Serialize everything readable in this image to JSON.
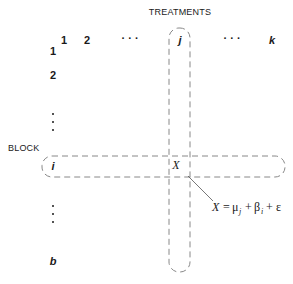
{
  "diagram": {
    "title": "TREATMENTS",
    "row_axis_label": "BLOCK",
    "columns": [
      {
        "label": "1",
        "x": 64
      },
      {
        "label": "2",
        "x": 87
      },
      {
        "label": "· · ·",
        "x": 130
      },
      {
        "label": "j",
        "x": 180
      },
      {
        "label": "· · ·",
        "x": 232
      },
      {
        "label": "k",
        "x": 272
      }
    ],
    "rows": [
      {
        "label": "1",
        "y": 54
      },
      {
        "label": "2",
        "y": 78
      },
      {
        "label": "i",
        "y": 170
      },
      {
        "label": "b",
        "y": 265
      }
    ],
    "row_ellipsis_upper": ".",
    "row_ellipsis_lower": ".",
    "cell_label": "X",
    "equation": {
      "lhs": "X",
      "equals": "=",
      "mu": "μ",
      "mu_sub": "j",
      "plus1": "+",
      "beta": "β",
      "beta_sub": "i",
      "plus2": "+",
      "epsilon": "ε"
    },
    "colors": {
      "text": "#1a1a1a",
      "dashed_band": "#888888",
      "background": "#ffffff"
    }
  }
}
